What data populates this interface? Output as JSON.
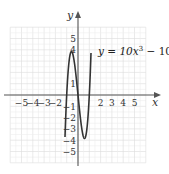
{
  "chart_data": {
    "type": "line",
    "title": "",
    "equation_label": "y = 10x³ − 10x",
    "equation_parts": {
      "lhs": "y = 10x",
      "exp": "3",
      "rhs": " − 10x"
    },
    "xlabel": "x",
    "ylabel": "y",
    "xlim": [
      -6,
      6
    ],
    "ylim": [
      -6,
      6
    ],
    "grid": true,
    "x_ticks": [
      -5,
      -4,
      -3,
      -2,
      2,
      3,
      4,
      5
    ],
    "x_tick_labels": [
      "−5",
      "−4",
      "−3",
      "−2",
      "2",
      "3",
      "4",
      "5"
    ],
    "y_ticks": [
      5,
      4,
      1,
      -1,
      -2,
      -3,
      -4,
      -5
    ],
    "y_tick_labels": [
      "5",
      "4",
      "1",
      "−1",
      "−2",
      "−3",
      "−4",
      "−5"
    ],
    "series": [
      {
        "name": "y = 10x^3 - 10x",
        "function": "10*x^3 - 10*x",
        "x_domain": [
          -1.15,
          1.15
        ],
        "key_points": [
          {
            "x": -1,
            "y": 0
          },
          {
            "x": -0.577,
            "y": 3.85
          },
          {
            "x": 0,
            "y": 0
          },
          {
            "x": 0.577,
            "y": -3.85
          },
          {
            "x": 1,
            "y": 0
          }
        ],
        "color": "#333333"
      }
    ],
    "colors": {
      "grid": "#dcdcdc",
      "axis": "#555555",
      "curve": "#333333",
      "text": "#333333"
    }
  }
}
